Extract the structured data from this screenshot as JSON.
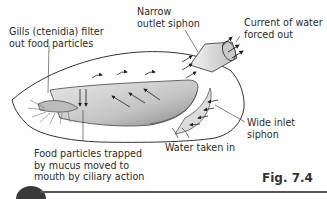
{
  "figure": {
    "caption": "Fig. 7.4"
  },
  "labels": {
    "gills": [
      "Gills (ctenidia) filter",
      "out food particles"
    ],
    "outlet_siphon": [
      "Narrow",
      "outlet siphon"
    ],
    "current_out": [
      "Current of water",
      "forced out"
    ],
    "inlet_siphon": [
      "Wide inlet",
      "siphon"
    ],
    "water_in": [
      "Water taken in"
    ],
    "food_particles": [
      "Food particles trapped",
      "by mucus moved to",
      "mouth by ciliary action"
    ]
  },
  "colors": {
    "outline": "#333333",
    "gill_fill": "#c8c8c8",
    "gill_dark": "#9a9a9a",
    "siphon_fill": "#e6e6e6",
    "bar": "#555555"
  }
}
